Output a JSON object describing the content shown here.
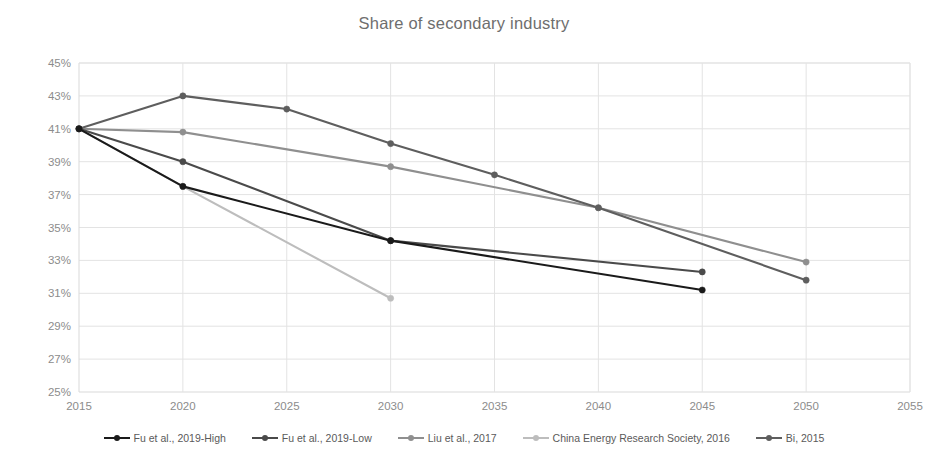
{
  "chart_data": {
    "type": "line",
    "title": "Share of secondary industry",
    "xlabel": "",
    "ylabel": "",
    "xlim": [
      2015,
      2055
    ],
    "ylim": [
      25,
      45
    ],
    "grid": "horizontal-and-vertical",
    "legend_position": "bottom",
    "x_ticks": [
      "2015",
      "2020",
      "2025",
      "2030",
      "2035",
      "2040",
      "2045",
      "2050",
      "2055"
    ],
    "y_ticks": [
      "25%",
      "27%",
      "29%",
      "31%",
      "33%",
      "35%",
      "37%",
      "39%",
      "41%",
      "43%",
      "45%"
    ],
    "y_tick_values": [
      25,
      27,
      29,
      31,
      33,
      35,
      37,
      39,
      41,
      43,
      45
    ],
    "x_tick_values": [
      2015,
      2020,
      2025,
      2030,
      2035,
      2040,
      2045,
      2050,
      2055
    ],
    "series": [
      {
        "name": "Fu et al., 2019-High",
        "color": "#1a1a1a",
        "x": [
          2015,
          2020,
          2030,
          2045
        ],
        "values": [
          41.0,
          37.5,
          34.2,
          31.2
        ]
      },
      {
        "name": "Fu et al., 2019-Low",
        "color": "#4a4a4a",
        "x": [
          2015,
          2020,
          2030,
          2045
        ],
        "values": [
          41.0,
          39.0,
          34.2,
          32.3
        ]
      },
      {
        "name": "Liu et al., 2017",
        "color": "#8f8f8f",
        "x": [
          2015,
          2020,
          2030,
          2040,
          2050
        ],
        "values": [
          41.0,
          40.8,
          38.7,
          36.2,
          32.9
        ]
      },
      {
        "name": "China Energy Research Society, 2016",
        "color": "#bdbdbd",
        "x": [
          2015,
          2020,
          2030
        ],
        "values": [
          41.0,
          37.5,
          30.7
        ]
      },
      {
        "name": "Bi, 2015",
        "color": "#5e5e5e",
        "x": [
          2015,
          2020,
          2025,
          2030,
          2035,
          2040,
          2050
        ],
        "values": [
          41.0,
          43.0,
          42.2,
          40.1,
          38.2,
          36.2,
          31.8
        ]
      }
    ],
    "colors": {
      "grid": "#e3e3e3",
      "axis": "#d9d9d9",
      "tick_text": "#8c8c8c",
      "title_text": "#6e6e6e",
      "legend_text": "#5a5a5a",
      "background": "#ffffff"
    }
  }
}
